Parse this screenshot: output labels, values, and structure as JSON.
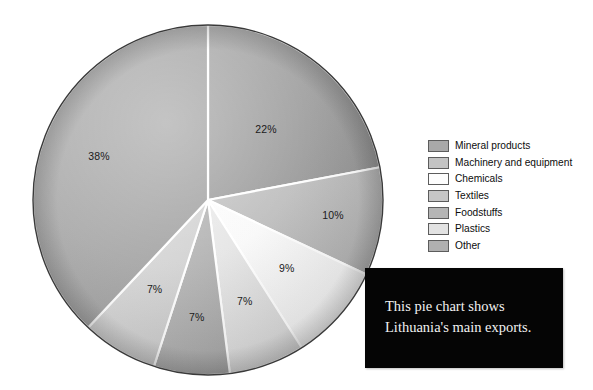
{
  "chart_data": {
    "type": "pie",
    "title": "",
    "subtitle": "",
    "xlabel": "",
    "ylabel": "",
    "legend_position": "right",
    "grid": false,
    "unit": "%",
    "categories": [
      "Mineral products",
      "Machinery and equipment",
      "Chemicals",
      "Textiles",
      "Foodstuffs",
      "Plastics",
      "Other"
    ],
    "values": [
      22,
      10,
      9,
      7,
      7,
      7,
      38
    ],
    "data_labels": [
      "22%",
      "10%",
      "9%",
      "7%",
      "7%",
      "7%",
      "38%"
    ],
    "colors": [
      "#a9a9a9",
      "#c3c3c3",
      "#fcfcfc",
      "#e9e9e9",
      "#b9b9b9",
      "#dcdcdc",
      "#b1b1b1"
    ],
    "slices": [
      {
        "label": "Mineral products",
        "value": 22,
        "data_label": "22%",
        "color": "#a9a9a9",
        "color_dark": "#8f8f8f"
      },
      {
        "label": "Machinery and equipment",
        "value": 10,
        "data_label": "10%",
        "color": "#c3c3c3",
        "color_dark": "#aeaeae"
      },
      {
        "label": "Chemicals",
        "value": 9,
        "data_label": "9%",
        "color": "#fcfcfc",
        "color_dark": "#ededed"
      },
      {
        "label": "Textiles",
        "value": 7,
        "data_label": "7%",
        "color": "#e9e9e9",
        "color_dark": "#d4d4d4"
      },
      {
        "label": "Foodstuffs",
        "value": 7,
        "data_label": "7%",
        "color": "#b9b9b9",
        "color_dark": "#a6a6a6"
      },
      {
        "label": "Plastics",
        "value": 7,
        "data_label": "7%",
        "color": "#dcdcdc",
        "color_dark": "#c8c8c8"
      },
      {
        "label": "Other",
        "value": 38,
        "data_label": "38%",
        "color": "#b1b1b1",
        "color_dark": "#9c9c9c"
      }
    ]
  },
  "legend": {
    "items": [
      {
        "label": "Mineral products",
        "color": "#a9a9a9"
      },
      {
        "label": "Machinery and equipment",
        "color": "#c3c3c3"
      },
      {
        "label": "Chemicals",
        "color": "#fdfdfd"
      },
      {
        "label": "Textiles",
        "color": "#c6c6c6"
      },
      {
        "label": "Foodstuffs",
        "color": "#b5b5b5"
      },
      {
        "label": "Plastics",
        "color": "#e2e2e2"
      },
      {
        "label": "Other",
        "color": "#b0b0b0"
      }
    ]
  },
  "caption": {
    "text": "This pie chart shows\nLithuania's main exports."
  },
  "colors": {
    "caption_background": "#050505",
    "caption_text": "#f2f2f2",
    "page_background": "#ffffff",
    "outline": "#3a3a3a"
  }
}
